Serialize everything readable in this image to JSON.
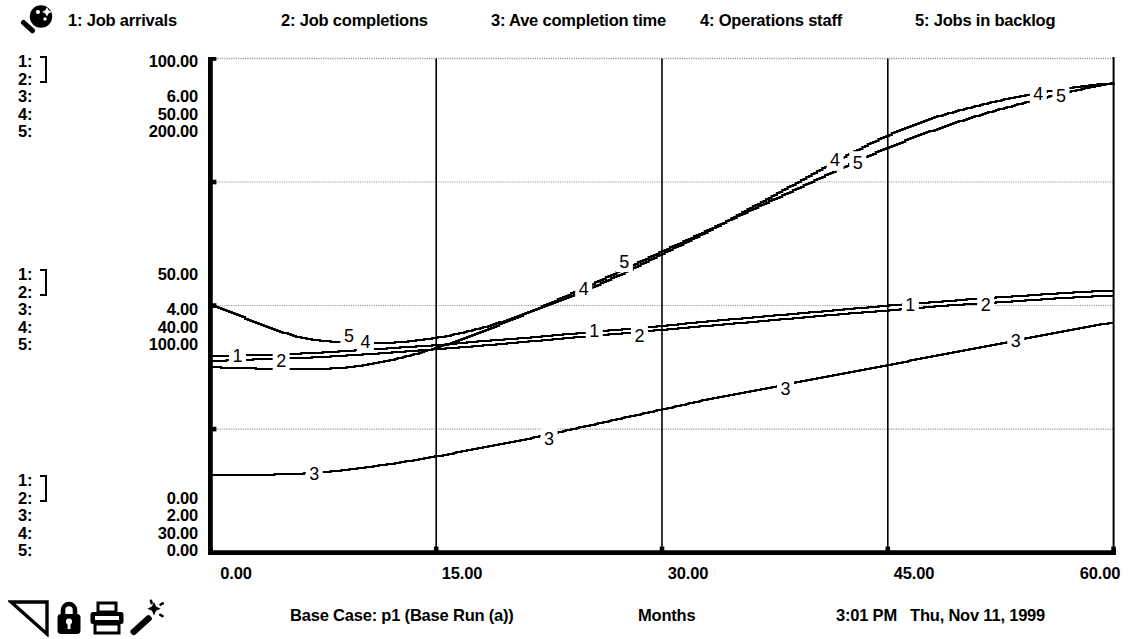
{
  "window": {
    "pad_icon": "magnifier-icon"
  },
  "legend": {
    "entries": [
      {
        "num": "1",
        "label": "1: Job arrivals",
        "x": 68
      },
      {
        "num": "2",
        "label": "2: Job completions",
        "x": 281
      },
      {
        "num": "3",
        "label": "3: Ave completion time",
        "x": 491
      },
      {
        "num": "4",
        "label": "4: Operations staff",
        "x": 700
      },
      {
        "num": "5",
        "label": "5: Jobs in backlog",
        "x": 915
      }
    ]
  },
  "scales": {
    "groups": [
      {
        "name": "top-scale-labels",
        "top": 53,
        "rows": [
          {
            "key": "1:",
            "value": "100.00"
          },
          {
            "key": "2:",
            "value": ""
          },
          {
            "key": "3:",
            "value": "6.00"
          },
          {
            "key": "4:",
            "value": "50.00"
          },
          {
            "key": "5:",
            "value": "200.00"
          }
        ]
      },
      {
        "name": "middle-scale-labels",
        "top": 266,
        "rows": [
          {
            "key": "1:",
            "value": "50.00"
          },
          {
            "key": "2:",
            "value": ""
          },
          {
            "key": "3:",
            "value": "4.00"
          },
          {
            "key": "4:",
            "value": "40.00"
          },
          {
            "key": "5:",
            "value": "100.00"
          }
        ]
      },
      {
        "name": "bottom-scale-labels",
        "top": 472,
        "rows": [
          {
            "key": "1:",
            "value": ""
          },
          {
            "key": "2:",
            "value": "0.00"
          },
          {
            "key": "3:",
            "value": "2.00"
          },
          {
            "key": "4:",
            "value": "30.00"
          },
          {
            "key": "5:",
            "value": "0.00"
          }
        ]
      }
    ]
  },
  "xaxis": {
    "ticks": [
      {
        "label": "0.00",
        "x": 212
      },
      {
        "label": "15.00",
        "x": 438
      },
      {
        "label": "30.00",
        "x": 665
      },
      {
        "label": "45.00",
        "x": 891
      },
      {
        "label": "60.00",
        "x": 1107
      }
    ]
  },
  "status": {
    "run_label": "Base Case: p1 (Base Run (a))",
    "x_title": "Months",
    "time": "3:01 PM",
    "date": "Thu, Nov 11, 1999",
    "tools": [
      {
        "name": "page-flip-icon",
        "x": 8
      },
      {
        "name": "lock-icon",
        "x": 56
      },
      {
        "name": "printer-icon",
        "x": 88
      },
      {
        "name": "wand-icon",
        "x": 128
      }
    ]
  },
  "chart_data": {
    "type": "line",
    "title": "Base Case: p1 (Base Run (a))",
    "xlabel": "Months",
    "ylabel": "",
    "xlim": [
      0,
      60
    ],
    "x_ticks": [
      0,
      15,
      30,
      45,
      60
    ],
    "grid": true,
    "grid_rows": 4,
    "legend_position": "top",
    "multi_axis": true,
    "axes": [
      {
        "series": [
          "1",
          "2"
        ],
        "name": "Jobs/Month",
        "min": 0,
        "mid": 50,
        "max": 100
      },
      {
        "series": [
          "3"
        ],
        "name": "Ave completion time",
        "min": 2,
        "mid": 4,
        "max": 6
      },
      {
        "series": [
          "4"
        ],
        "name": "Operations staff",
        "min": 30,
        "mid": 40,
        "max": 50
      },
      {
        "series": [
          "5"
        ],
        "name": "Jobs in backlog",
        "min": 0,
        "mid": 100,
        "max": 200
      }
    ],
    "x": [
      0,
      3,
      6,
      9,
      12,
      15,
      18,
      21,
      24,
      27,
      30,
      33,
      36,
      39,
      42,
      45,
      48,
      51,
      54,
      57,
      60
    ],
    "series": [
      {
        "name": "1: Job arrivals",
        "num": "1",
        "axis_min": 0,
        "axis_max": 100,
        "values": [
          39.8,
          40.0,
          40.3,
          40.8,
          41.4,
          42.0,
          42.8,
          43.5,
          44.3,
          45.1,
          45.9,
          46.8,
          47.6,
          48.4,
          49.2,
          50.0,
          50.7,
          51.4,
          52.0,
          52.6,
          53.0
        ],
        "label_points": [
          {
            "x": 1.8,
            "y": 39.8
          },
          {
            "x": 25.5,
            "y": 45.0
          },
          {
            "x": 46.5,
            "y": 50.3
          }
        ]
      },
      {
        "name": "2: Job completions",
        "num": "2",
        "axis_min": 0,
        "axis_max": 100,
        "values": [
          38.8,
          39.1,
          39.4,
          39.9,
          40.5,
          41.2,
          41.9,
          42.7,
          43.5,
          44.3,
          45.1,
          45.9,
          46.7,
          47.5,
          48.3,
          49.0,
          49.8,
          50.4,
          51.0,
          51.6,
          52.0
        ],
        "label_points": [
          {
            "x": 4.7,
            "y": 38.9
          },
          {
            "x": 28.5,
            "y": 44.0
          },
          {
            "x": 51.5,
            "y": 50.2
          }
        ]
      },
      {
        "name": "3: Ave completion time",
        "num": "3",
        "axis_min": 2,
        "axis_max": 6,
        "values": [
          2.63,
          2.63,
          2.64,
          2.67,
          2.72,
          2.78,
          2.85,
          2.92,
          3.0,
          3.08,
          3.16,
          3.24,
          3.31,
          3.38,
          3.45,
          3.52,
          3.59,
          3.66,
          3.73,
          3.8,
          3.86
        ],
        "label_points": [
          {
            "x": 6.9,
            "y": 2.64
          },
          {
            "x": 22.5,
            "y": 2.92
          },
          {
            "x": 38.2,
            "y": 3.33
          },
          {
            "x": 53.5,
            "y": 3.72
          }
        ]
      },
      {
        "name": "4: Operations staff",
        "num": "4",
        "axis_min": 30,
        "axis_max": 50,
        "values": [
          40.0,
          39.3,
          38.7,
          38.5,
          38.5,
          38.7,
          39.1,
          39.7,
          40.4,
          41.2,
          42.1,
          43.0,
          44.0,
          45.0,
          46.0,
          46.9,
          47.6,
          48.1,
          48.5,
          48.8,
          49.0
        ],
        "label_points": [
          {
            "x": 10.3,
            "y": 38.55
          },
          {
            "x": 24.8,
            "y": 40.7
          },
          {
            "x": 41.5,
            "y": 45.9
          },
          {
            "x": 55.0,
            "y": 48.6
          }
        ]
      },
      {
        "name": "5: Jobs in backlog",
        "num": "5",
        "axis_min": 0,
        "axis_max": 200,
        "values": [
          75.0,
          74.5,
          74.2,
          75.0,
          78.0,
          83.0,
          89.5,
          97.0,
          105.0,
          113.5,
          122.0,
          130.5,
          139.0,
          147.5,
          156.0,
          164.0,
          171.0,
          177.0,
          182.0,
          186.5,
          190.0
        ],
        "label_points": [
          {
            "x": 9.2,
            "y": 88.0
          },
          {
            "x": 27.5,
            "y": 118.0
          },
          {
            "x": 43.0,
            "y": 158.0
          },
          {
            "x": 56.5,
            "y": 185.0
          }
        ]
      }
    ]
  }
}
